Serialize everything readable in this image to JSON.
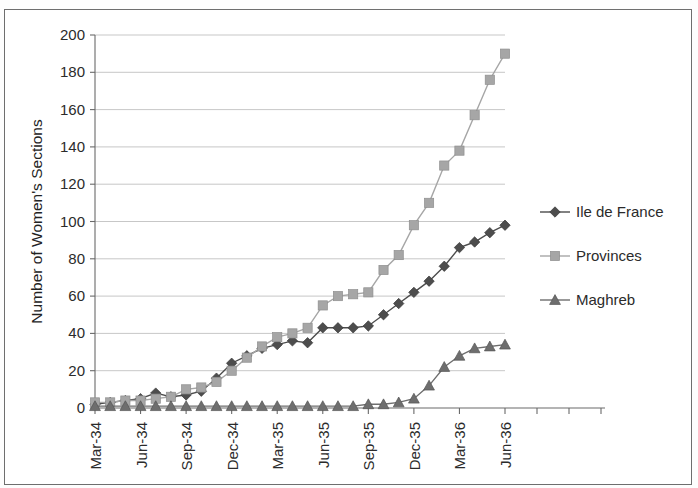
{
  "chart_data": {
    "type": "line",
    "title": "",
    "xlabel": "",
    "ylabel": "Number of Women's Sections",
    "ylim": [
      0,
      200
    ],
    "ytick_step": 20,
    "yticks": [
      0,
      20,
      40,
      60,
      80,
      100,
      120,
      140,
      160,
      180,
      200
    ],
    "grid": true,
    "legend_position": "right",
    "x": [
      "Mar-34",
      "Apr-34",
      "May-34",
      "Jun-34",
      "Jul-34",
      "Aug-34",
      "Sep-34",
      "Oct-34",
      "Nov-34",
      "Dec-34",
      "Jan-35",
      "Feb-35",
      "Mar-35",
      "Apr-35",
      "May-35",
      "Jun-35",
      "Jul-35",
      "Aug-35",
      "Sep-35",
      "Oct-35",
      "Nov-35",
      "Dec-35",
      "Jan-36",
      "Feb-36",
      "Mar-36",
      "Apr-36",
      "May-36",
      "Jun-36"
    ],
    "xtick_labels": [
      "Mar-34",
      "Jun-34",
      "Sep-34",
      "Dec-34",
      "Mar-35",
      "Jun-35",
      "Sep-35",
      "Dec-35",
      "Mar-36",
      "Jun-36"
    ],
    "xtick_indices": [
      0,
      3,
      6,
      9,
      12,
      15,
      18,
      21,
      24,
      27
    ],
    "series": [
      {
        "name": "Ile de France",
        "marker": "diamond",
        "color": "#4d4d4d",
        "values": [
          2,
          3,
          4,
          5,
          8,
          6,
          7,
          9,
          16,
          24,
          28,
          32,
          34,
          36,
          35,
          43,
          43,
          43,
          44,
          50,
          56,
          62,
          68,
          76,
          86,
          89,
          94,
          98
        ]
      },
      {
        "name": "Provinces",
        "marker": "square",
        "color": "#a6a6a6",
        "values": [
          3,
          3,
          4,
          4,
          5,
          6,
          10,
          11,
          14,
          20,
          27,
          33,
          38,
          40,
          43,
          55,
          60,
          61,
          62,
          74,
          82,
          98,
          110,
          130,
          138,
          157,
          176,
          190
        ]
      },
      {
        "name": "Maghreb",
        "marker": "triangle",
        "color": "#6e6e6e",
        "values": [
          1,
          1,
          1,
          1,
          1,
          1,
          1,
          1,
          1,
          1,
          1,
          1,
          1,
          1,
          1,
          1,
          1,
          1,
          2,
          2,
          3,
          5,
          12,
          22,
          28,
          32,
          33,
          34
        ]
      }
    ]
  }
}
